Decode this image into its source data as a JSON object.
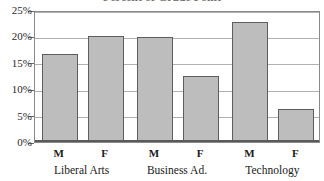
{
  "chart_data": {
    "type": "bar",
    "title": "Percent of Grade Point",
    "xlabel": "",
    "ylabel": "",
    "ylim": [
      0,
      25
    ],
    "grid": true,
    "legend": "none",
    "categories": [
      "Liberal Arts",
      "Business Ad.",
      "Technology"
    ],
    "subcategories": [
      "M",
      "F"
    ],
    "ytick_labels": [
      "0%",
      "5%",
      "10%",
      "15%",
      "20%",
      "25%"
    ],
    "ytick_values": [
      0,
      5,
      10,
      15,
      20,
      25
    ],
    "bars": [
      {
        "group": "Liberal Arts",
        "series": "M",
        "value": 16.7
      },
      {
        "group": "Liberal Arts",
        "series": "F",
        "value": 20.0
      },
      {
        "group": "Business Ad.",
        "series": "M",
        "value": 19.8
      },
      {
        "group": "Business Ad.",
        "series": "F",
        "value": 12.5
      },
      {
        "group": "Technology",
        "series": "M",
        "value": 22.8
      },
      {
        "group": "Technology",
        "series": "F",
        "value": 6.3
      }
    ],
    "series": [
      {
        "name": "M",
        "values": [
          16.7,
          19.8,
          22.8
        ]
      },
      {
        "name": "F",
        "values": [
          20.0,
          12.5,
          6.3
        ]
      }
    ],
    "colors": {
      "bar_fill": "#bdbdbd",
      "bar_border": "#5e5e5e",
      "gridline": "#b0b0b0",
      "frame": "#8a8a8a",
      "text": "#1a1a1a",
      "background": "#ffffff"
    }
  }
}
